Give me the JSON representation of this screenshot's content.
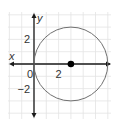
{
  "chart_data": {
    "type": "scatter",
    "title": "",
    "xlabel": "x",
    "ylabel": "y",
    "xlim": [
      -2,
      6
    ],
    "ylim": [
      -4,
      4
    ],
    "grid": true,
    "x_ticks": [
      {
        "value": 0,
        "label": "0"
      },
      {
        "value": 2,
        "label": "2"
      }
    ],
    "y_ticks": [
      {
        "value": 2,
        "label": "2"
      },
      {
        "value": -2,
        "label": "−2"
      }
    ],
    "circle": {
      "center": [
        3,
        0
      ],
      "radius": 3
    },
    "points": [
      {
        "x": 3,
        "y": 0,
        "label": "center"
      }
    ],
    "ray": {
      "from": [
        3,
        0
      ],
      "direction": "positive-x"
    }
  },
  "colors": {
    "axis": "#1a1a1a",
    "grid": "#e3e3e3",
    "circle": "#707070",
    "point": "#000000"
  }
}
